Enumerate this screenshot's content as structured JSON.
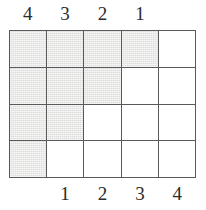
{
  "figure": {
    "name": "staircase-grid-diagram",
    "grid": {
      "columns": 5,
      "rows": 4,
      "fill_color": "#dededd",
      "empty_color": "#ffffff",
      "line_color": "#59595c",
      "filled_counts_per_row": [
        4,
        3,
        2,
        1
      ],
      "cells": [
        [
          "filled",
          "filled",
          "filled",
          "filled",
          "empty"
        ],
        [
          "filled",
          "filled",
          "filled",
          "empty",
          "empty"
        ],
        [
          "filled",
          "filled",
          "empty",
          "empty",
          "empty"
        ],
        [
          "filled",
          "empty",
          "empty",
          "empty",
          "empty"
        ]
      ]
    },
    "top_labels": [
      {
        "text": "4",
        "column": 0
      },
      {
        "text": "3",
        "column": 1
      },
      {
        "text": "2",
        "column": 2
      },
      {
        "text": "1",
        "column": 3
      }
    ],
    "bottom_labels": [
      {
        "text": "1",
        "column": 1
      },
      {
        "text": "2",
        "column": 2
      },
      {
        "text": "3",
        "column": 3
      },
      {
        "text": "4",
        "column": 4
      }
    ]
  }
}
